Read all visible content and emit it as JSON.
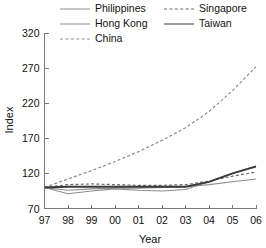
{
  "chart_data": {
    "type": "line",
    "title": "",
    "xlabel": "Year",
    "ylabel": "Index",
    "x": [
      97,
      98,
      99,
      0,
      1,
      2,
      3,
      4,
      5,
      6
    ],
    "x_tick_labels": [
      "97",
      "98",
      "99",
      "00",
      "01",
      "02",
      "03",
      "04",
      "05",
      "06"
    ],
    "y_tick_labels": [
      "70",
      "120",
      "170",
      "220",
      "270",
      "320"
    ],
    "y_ticks": [
      70,
      120,
      170,
      220,
      270,
      320
    ],
    "ylim": [
      70,
      320
    ],
    "xlim": [
      97,
      106
    ],
    "grid": false,
    "legend_position": "top",
    "series": [
      {
        "name": "Philippines",
        "style": "solid-thin",
        "color": "#8d8d8d",
        "values": [
          100,
          96,
          98,
          99,
          99,
          100,
          101,
          104,
          108,
          112
        ]
      },
      {
        "name": "Hong Kong",
        "style": "solid-thin",
        "color": "#8d8d8d",
        "values": [
          100,
          91,
          95,
          98,
          96,
          95,
          97,
          108,
          120,
          129
        ]
      },
      {
        "name": "China",
        "style": "dashed",
        "color": "#8d8d8d",
        "values": [
          100,
          112,
          124,
          137,
          151,
          167,
          185,
          208,
          238,
          272
        ]
      },
      {
        "name": "Singapore",
        "style": "dashed",
        "color": "#6a6a6a",
        "values": [
          100,
          104,
          105,
          104,
          103,
          103,
          104,
          109,
          116,
          122
        ]
      },
      {
        "name": "Taiwan",
        "style": "solid-thick",
        "color": "#3a3a3a",
        "values": [
          100,
          101,
          101,
          101,
          101,
          101,
          101,
          108,
          120,
          130
        ]
      }
    ]
  },
  "legend": {
    "items": [
      {
        "label": "Philippines",
        "style": "solid-thin"
      },
      {
        "label": "Hong Kong",
        "style": "solid-thin"
      },
      {
        "label": "China",
        "style": "dashed"
      },
      {
        "label": "Singapore",
        "style": "dashed"
      },
      {
        "label": "Taiwan",
        "style": "solid-thick"
      }
    ]
  }
}
